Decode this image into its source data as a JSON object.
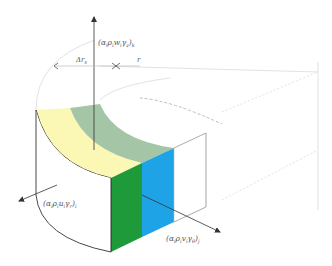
{
  "diagram": {
    "type": "control-volume-sector",
    "colors": {
      "top_yellow": "#fbf7b4",
      "top_green": "#a5c6a6",
      "face_green": "#1f9a3a",
      "face_blue": "#1ea3e6",
      "line": "#333333",
      "light_line": "#c8c8c8"
    },
    "labels": {
      "top_flux": "(α",
      "top_flux_sub1": "i",
      "top_flux_mid": "ρ",
      "top_flux_sub2": "i",
      "top_flux_w": "w",
      "top_flux_sub3": "i",
      "top_flux_gamma": "γ",
      "top_flux_sub4": "z",
      "top_flux_close": ")",
      "top_flux_outer": "k",
      "delta_rs": "Δr",
      "delta_rs_sub": "s",
      "r": "r",
      "left_flux": "(α",
      "left_flux_sub1": "i",
      "left_flux_mid": "ρ",
      "left_flux_sub2": "i",
      "left_flux_u": "u",
      "left_flux_sub3": "i",
      "left_flux_gamma": "γ",
      "left_flux_sub4": "r",
      "left_flux_close": ")",
      "left_flux_outer": "i",
      "right_flux": "(α",
      "right_flux_sub1": "i",
      "right_flux_mid": "ρ",
      "right_flux_sub2": "i",
      "right_flux_v": "v",
      "right_flux_sub3": "i",
      "right_flux_gamma": "γ",
      "right_flux_sub4": "θ",
      "right_flux_close": ")",
      "right_flux_outer": "j"
    }
  }
}
